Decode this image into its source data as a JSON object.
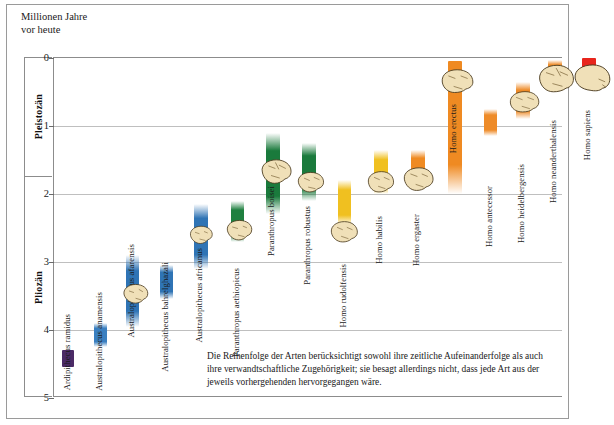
{
  "figure": {
    "axis_caption": "Millionen Jahre\nvor heute",
    "footnote": "Die Reihenfolge der Arten berücksichtigt sowohl ihre zeitliche Aufeinanderfolge als auch ihre verwandtschaftliche Zugehörigkeit; sie besagt allerdings nicht, dass jede Art aus der jeweils vorhergehenden hervorgegangen wäre."
  },
  "chart_data": {
    "type": "bar",
    "title": "",
    "xlabel": "",
    "ylabel": "Millionen Jahre vor heute",
    "ylim": [
      0,
      5
    ],
    "y_inverted": false,
    "grid": true,
    "legend": "none",
    "tick_labels": [
      "0",
      "1",
      "2",
      "3",
      "4",
      "5"
    ],
    "tick_values": [
      0,
      1,
      2,
      3,
      4,
      5
    ],
    "epochs": [
      {
        "name": "Pleistozän",
        "from": 0.0,
        "to": 1.75
      },
      {
        "name": "Pliozän",
        "from": 1.75,
        "to": 5.0
      }
    ],
    "colors": {
      "ardipithecus": "#4b2a66",
      "australopithecus": "#2f74b5",
      "paranthropus": "#1a7a3c",
      "homo_early": "#f0c020",
      "homo_ergaster": "#ef8a22",
      "homo_late": "#ee8b28",
      "homo_sapiens": "#e8251c"
    },
    "categories": [
      "Ardipithecus ramidus",
      "Australopithecus anamensis",
      "Australopithecus afarensis",
      "Australopithecus bahrelghazali",
      "Australopithecus africanus",
      "Paranthropus aethiopicus",
      "Paranthropus boisei",
      "Paranthropus robustus",
      "Homo rudolfensis",
      "Homo habilis",
      "Homo ergaster",
      "Homo erectus",
      "Homo antecessor",
      "Homo heidelbergensis",
      "Homo neanderthalensis",
      "Homo sapiens"
    ],
    "bars": [
      {
        "name": "Ardipithecus ramidus",
        "start_ma": 4.55,
        "end_ma": 4.3,
        "color": "#4b2a66",
        "fade_top": false,
        "fade_bottom": false,
        "x": 8,
        "w": 12,
        "label_y": 256,
        "skull": null
      },
      {
        "name": "Australopithecus anamensis",
        "start_ma": 4.25,
        "end_ma": 3.9,
        "color": "#3a7fc0",
        "fade_top": true,
        "fade_bottom": true,
        "x": 40,
        "w": 13,
        "label_y": 234,
        "skull": null
      },
      {
        "name": "Australopithecus afarensis",
        "start_ma": 3.95,
        "end_ma": 2.9,
        "color": "#2f74b5",
        "fade_top": true,
        "fade_bottom": true,
        "x": 72,
        "w": 13,
        "label_y": 186,
        "skull": {
          "x": 64,
          "y": 224,
          "w": 40,
          "h": 26,
          "type": "afarensis"
        }
      },
      {
        "name": "Australopithecus bahrelghazali",
        "start_ma": 3.55,
        "end_ma": 3.05,
        "color": "#2f74b5",
        "fade_top": true,
        "fade_bottom": true,
        "x": 106,
        "w": 13,
        "label_y": 204,
        "skull": null
      },
      {
        "name": "Australopithecus africanus",
        "start_ma": 3.1,
        "end_ma": 2.15,
        "color": "#2f74b5",
        "fade_top": true,
        "fade_bottom": true,
        "x": 140,
        "w": 14,
        "label_y": 190,
        "skull": {
          "x": 132,
          "y": 166,
          "w": 36,
          "h": 24,
          "type": "africanus"
        }
      },
      {
        "name": "Paranthropus aethiopicus",
        "start_ma": 2.7,
        "end_ma": 2.1,
        "color": "#1f8040",
        "fade_top": true,
        "fade_bottom": true,
        "x": 177,
        "w": 13,
        "label_y": 210,
        "skull": {
          "x": 169,
          "y": 160,
          "w": 38,
          "h": 26,
          "type": "aethiopicus"
        }
      },
      {
        "name": "Paranthropus boisei",
        "start_ma": 2.3,
        "end_ma": 1.1,
        "color": "#1a7a3c",
        "fade_top": true,
        "fade_bottom": true,
        "x": 212,
        "w": 14,
        "label_y": 128,
        "skull": {
          "x": 204,
          "y": 100,
          "w": 40,
          "h": 28,
          "type": "boisei"
        }
      },
      {
        "name": "Paranthropus robustus",
        "start_ma": 2.1,
        "end_ma": 1.25,
        "color": "#1a7a3c",
        "fade_top": true,
        "fade_bottom": true,
        "x": 248,
        "w": 14,
        "label_y": 148,
        "skull": {
          "x": 240,
          "y": 112,
          "w": 38,
          "h": 26,
          "type": "robustus"
        }
      },
      {
        "name": "Homo rudolfensis",
        "start_ma": 2.45,
        "end_ma": 1.8,
        "color": "#f0c020",
        "fade_top": true,
        "fade_bottom": true,
        "x": 284,
        "w": 13,
        "label_y": 206,
        "skull": {
          "x": 272,
          "y": 162,
          "w": 40,
          "h": 26,
          "type": "rudolfensis"
        }
      },
      {
        "name": "Homo habilis",
        "start_ma": 2.0,
        "end_ma": 1.35,
        "color": "#f0c020",
        "fade_top": true,
        "fade_bottom": true,
        "x": 320,
        "w": 14,
        "label_y": 158,
        "skull": {
          "x": 310,
          "y": 112,
          "w": 38,
          "h": 26,
          "type": "habilis"
        }
      },
      {
        "name": "Homo ergaster",
        "start_ma": 1.9,
        "end_ma": 1.35,
        "color": "#ef8a22",
        "fade_top": true,
        "fade_bottom": true,
        "x": 357,
        "w": 14,
        "label_y": 156,
        "skull": {
          "x": 346,
          "y": 108,
          "w": 40,
          "h": 28,
          "type": "ergaster"
        }
      },
      {
        "name": "Homo erectus",
        "start_ma": 2.0,
        "end_ma": 0.05,
        "color": "#ef8a22",
        "fade_top": false,
        "fade_bottom": true,
        "x": 394,
        "w": 14,
        "label_y": 46,
        "skull": {
          "x": 383,
          "y": 10,
          "w": 42,
          "h": 28,
          "type": "erectus"
        }
      },
      {
        "name": "Homo antecessor",
        "start_ma": 1.15,
        "end_ma": 0.75,
        "color": "#ee8b28",
        "fade_top": true,
        "fade_bottom": true,
        "x": 430,
        "w": 13,
        "label_y": 128,
        "skull": null
      },
      {
        "name": "Homo heidelbergensis",
        "start_ma": 0.9,
        "end_ma": 0.35,
        "color": "#ee8b28",
        "fade_top": true,
        "fade_bottom": true,
        "x": 462,
        "w": 14,
        "label_y": 106,
        "skull": {
          "x": 450,
          "y": 32,
          "w": 42,
          "h": 26,
          "type": "heidelbergensis"
        }
      },
      {
        "name": "Homo neanderthalensis",
        "start_ma": 0.35,
        "end_ma": 0.03,
        "color": "#ee8b28",
        "fade_top": true,
        "fade_bottom": true,
        "x": 494,
        "w": 14,
        "label_y": 62,
        "skull": {
          "x": 482,
          "y": 6,
          "w": 42,
          "h": 30,
          "type": "neanderthalensis"
        }
      },
      {
        "name": "Homo sapiens",
        "start_ma": 0.18,
        "end_ma": 0.0,
        "color": "#e8251c",
        "fade_top": false,
        "fade_bottom": false,
        "x": 528,
        "w": 14,
        "label_y": 52,
        "skull": {
          "x": 516,
          "y": 6,
          "w": 44,
          "h": 30,
          "type": "sapiens"
        }
      }
    ]
  }
}
